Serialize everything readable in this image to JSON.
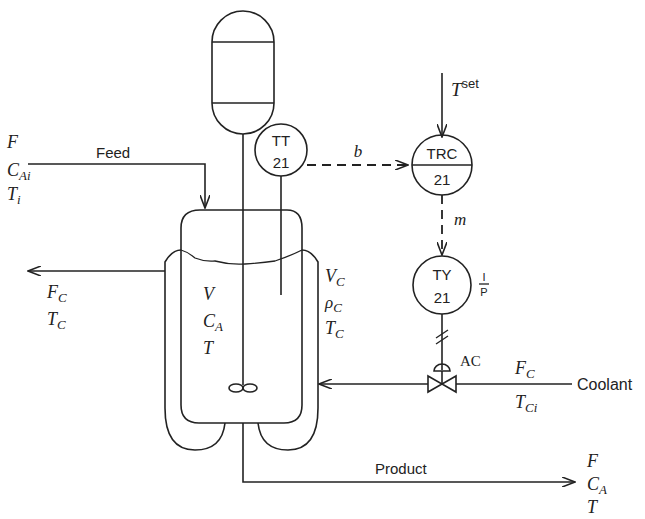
{
  "diagram": {
    "type": "CSTR temperature control loop (P&ID)",
    "streams": {
      "feed": {
        "label": "Feed",
        "vars": [
          "F",
          "C",
          "T"
        ],
        "subs": [
          "",
          "Ai",
          "i"
        ]
      },
      "product": {
        "label": "Product",
        "vars": [
          "F",
          "C",
          "T"
        ],
        "subs": [
          "",
          "A",
          ""
        ]
      },
      "coolant_in": {
        "label": "Coolant",
        "vars": [
          "F",
          "T"
        ],
        "subs": [
          "C",
          "Ci"
        ]
      },
      "coolant_out": {
        "vars": [
          "F",
          "T"
        ],
        "subs": [
          "C",
          "C"
        ]
      }
    },
    "reactor": {
      "vars": [
        "V",
        "C",
        "T"
      ],
      "subs": [
        "",
        "A",
        ""
      ]
    },
    "jacket": {
      "vars": [
        "V",
        "ρ",
        "T"
      ],
      "subs": [
        "C",
        "C",
        "C"
      ]
    },
    "instruments": {
      "tt": {
        "tag": "TT",
        "loop": "21"
      },
      "trc": {
        "tag": "TRC",
        "loop": "21"
      },
      "ty": {
        "tag": "TY",
        "loop": "21",
        "conv_top": "I",
        "conv_bottom": "P"
      }
    },
    "signals": {
      "b": "b",
      "m": "m",
      "setpoint": "T",
      "setpoint_sup": "set"
    },
    "valve": {
      "action": "AC"
    }
  }
}
